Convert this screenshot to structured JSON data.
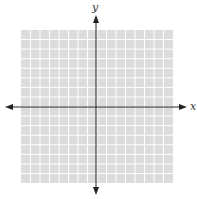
{
  "diagram": {
    "type": "coordinate-plane",
    "x_axis_label": "x",
    "y_axis_label": "y",
    "grid": {
      "columns": 16,
      "rows": 16,
      "fill_color": "#dcdcdc",
      "line_color": "#ffffff"
    },
    "axis_color": "#222222"
  }
}
